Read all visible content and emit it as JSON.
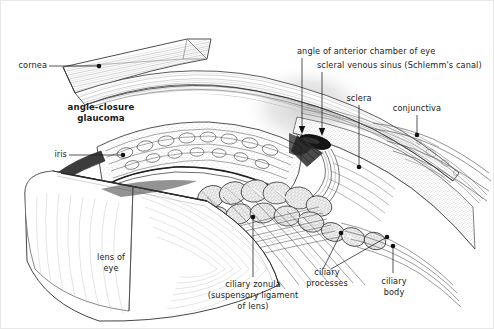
{
  "figure": {
    "title": "angle-closure glaucoma",
    "type": "anatomical-illustration",
    "width": 494,
    "height": 329,
    "background_color": "#ffffff",
    "ink_color": "#1b1b1b",
    "shadow_color": "#d9d9d9"
  },
  "labels": {
    "cornea": "cornea",
    "angle_closure_glaucoma_line1": "angle-closure",
    "angle_closure_glaucoma_line2": "glaucoma",
    "iris": "iris",
    "angle_of_anterior_chamber": "angle of anterior chamber of eye",
    "scleral_venous_sinus": "scleral venous sinus (Schlemm's canal)",
    "sclera": "sclera",
    "conjunctiva": "conjunctiva",
    "lens_of_eye_line1": "lens of",
    "lens_of_eye_line2": "eye",
    "ciliary_zonula_line1": "ciliary zonula",
    "ciliary_zonula_line2": "(suspensory ligament",
    "ciliary_zonula_line3": "of lens)",
    "ciliary_processes_line1": "ciliary",
    "ciliary_processes_line2": "processes",
    "ciliary_body_line1": "ciliary",
    "ciliary_body_line2": "body"
  }
}
